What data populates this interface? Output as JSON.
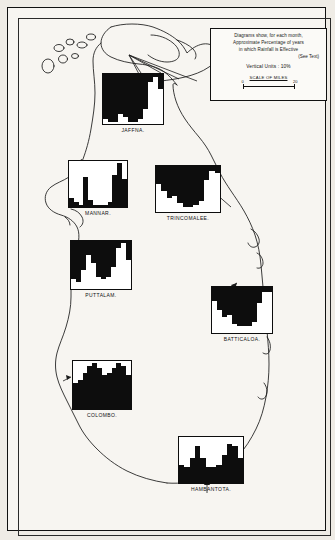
{
  "legend": {
    "line1": "Diagrams show, for each month,",
    "line2": "Approximate Percentage of years",
    "line3": "in which Rainfall is Effective",
    "see_text": "(See Text)",
    "vertical_units": "Vertical Units : 10%",
    "scale_title": "SCALE OF MILES",
    "scale_min": "0",
    "scale_max": "20"
  },
  "colors": {
    "ink": "#0d0d0d",
    "paper": "#f7f5f1",
    "page": "#efece6"
  },
  "chart_data": {
    "type": "bar",
    "title": "Approximate Percentage of years in which Rainfall is Effective",
    "xlabel": "Month",
    "ylabel": "Percentage of years (Vertical Units : 10%)",
    "ylim": [
      0,
      100
    ],
    "grid": false,
    "legend_position": "top-right",
    "categories": [
      "J",
      "F",
      "M",
      "A",
      "M",
      "J",
      "J",
      "A",
      "S",
      "O",
      "N",
      "D"
    ],
    "series": [
      {
        "name": "JAFFNA.",
        "style": "inverted",
        "values": [
          10,
          5,
          5,
          20,
          15,
          5,
          5,
          10,
          30,
          85,
          95,
          70
        ]
      },
      {
        "name": "MANNAR.",
        "style": "normal",
        "values": [
          20,
          10,
          5,
          65,
          15,
          5,
          5,
          5,
          10,
          70,
          95,
          60
        ]
      },
      {
        "name": "TRINCOMALEE.",
        "style": "inverted",
        "values": [
          60,
          45,
          30,
          35,
          20,
          10,
          10,
          15,
          25,
          70,
          90,
          85
        ]
      },
      {
        "name": "PUTTALAM.",
        "style": "inverted",
        "values": [
          20,
          15,
          40,
          70,
          55,
          25,
          20,
          25,
          45,
          85,
          95,
          60
        ]
      },
      {
        "name": "BATTICALOA.",
        "style": "inverted",
        "values": [
          70,
          50,
          35,
          40,
          20,
          15,
          15,
          15,
          25,
          65,
          90,
          90
        ]
      },
      {
        "name": "COLOMBO.",
        "style": "normal",
        "values": [
          55,
          60,
          75,
          90,
          95,
          85,
          70,
          75,
          85,
          95,
          90,
          70
        ]
      },
      {
        "name": "HAMBANTOTA.",
        "style": "normal",
        "values": [
          40,
          35,
          55,
          80,
          55,
          35,
          35,
          40,
          60,
          85,
          80,
          55
        ]
      }
    ]
  }
}
